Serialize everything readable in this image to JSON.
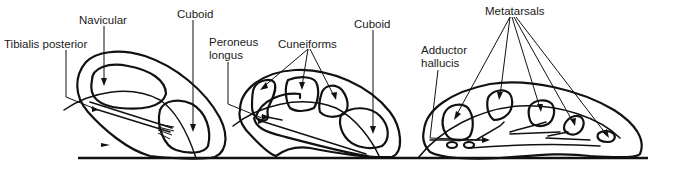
{
  "figure": {
    "panels": [
      {
        "id": "panel-1",
        "description": "Cross-section through navicular and cuboid",
        "labels": [
          {
            "key": "tibialis_posterior",
            "text": "Tibialis posterior"
          },
          {
            "key": "navicular",
            "text": "Navicular"
          },
          {
            "key": "cuboid",
            "text": "Cuboid"
          }
        ]
      },
      {
        "id": "panel-2",
        "description": "Cross-section through cuneiforms and cuboid",
        "labels": [
          {
            "key": "peroneus_longus_line1",
            "text": "Peroneus"
          },
          {
            "key": "peroneus_longus_line2",
            "text": "longus"
          },
          {
            "key": "cuneiforms",
            "text": "Cuneiforms"
          },
          {
            "key": "cuboid",
            "text": "Cuboid"
          }
        ]
      },
      {
        "id": "panel-3",
        "description": "Cross-section through metatarsals",
        "labels": [
          {
            "key": "adductor_hallucis_line1",
            "text": "Adductor"
          },
          {
            "key": "adductor_hallucis_line2",
            "text": "hallucis"
          },
          {
            "key": "metatarsals",
            "text": "Metatarsals"
          }
        ]
      }
    ],
    "colors": {
      "line": "#111111",
      "background": "#ffffff"
    }
  }
}
